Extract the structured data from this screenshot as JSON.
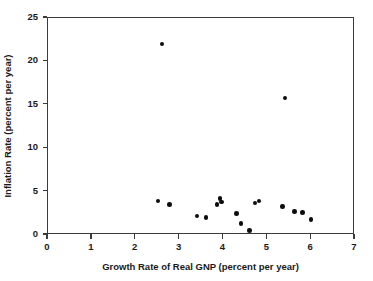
{
  "chart_data": {
    "type": "scatter",
    "title": "",
    "xlabel": "Growth Rate of Real GNP (percent per year)",
    "ylabel": "Inflation Rate (percent per year)",
    "xlim": [
      0,
      7
    ],
    "ylim": [
      0,
      25
    ],
    "xticks": [
      0,
      1,
      2,
      3,
      4,
      5,
      6,
      7
    ],
    "yticks": [
      0,
      5,
      10,
      15,
      20,
      25
    ],
    "xtick_labels": [
      "0",
      "1",
      "2",
      "3",
      "4",
      "5",
      "6",
      "7"
    ],
    "ytick_labels": [
      "0",
      "5",
      "10",
      "15",
      "20",
      "25"
    ],
    "grid": false,
    "legend": false,
    "marker": "filled-circle",
    "marker_color": "#0d0d0d",
    "axis_color": "#3b3b3b",
    "background": "#ffffff",
    "points": [
      {
        "x": 2.6,
        "y": 22.0
      },
      {
        "x": 5.4,
        "y": 15.8
      },
      {
        "x": 2.51,
        "y": 3.9
      },
      {
        "x": 2.77,
        "y": 3.5
      },
      {
        "x": 3.4,
        "y": 2.2
      },
      {
        "x": 3.6,
        "y": 2.0
      },
      {
        "x": 3.85,
        "y": 3.5
      },
      {
        "x": 3.92,
        "y": 4.2
      },
      {
        "x": 3.95,
        "y": 3.8
      },
      {
        "x": 4.3,
        "y": 2.5
      },
      {
        "x": 4.4,
        "y": 1.3
      },
      {
        "x": 4.6,
        "y": 0.5
      },
      {
        "x": 4.72,
        "y": 3.7
      },
      {
        "x": 4.81,
        "y": 3.9
      },
      {
        "x": 5.35,
        "y": 3.3
      },
      {
        "x": 5.62,
        "y": 2.7
      },
      {
        "x": 5.8,
        "y": 2.6
      },
      {
        "x": 6.0,
        "y": 1.8
      }
    ]
  }
}
